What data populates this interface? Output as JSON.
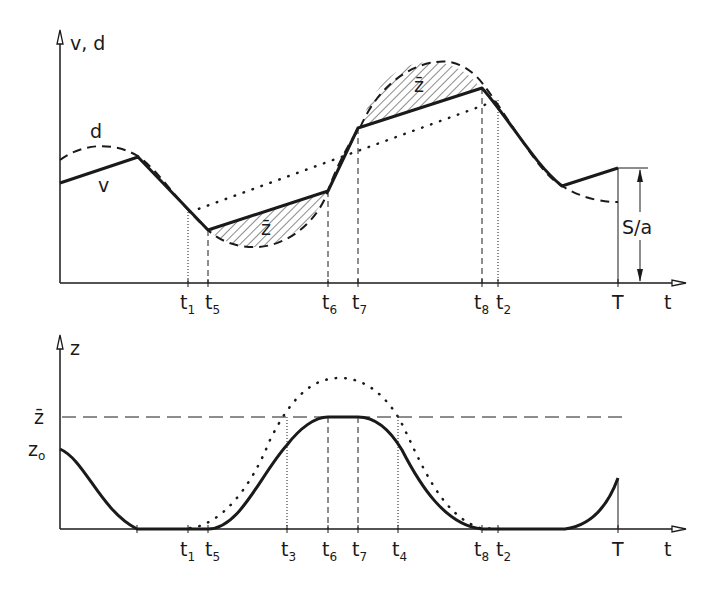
{
  "top_panel": {
    "y_axis_label": "v, d",
    "x_axis_label": "t",
    "curve_labels": {
      "d": "d",
      "v": "v"
    },
    "area_label": "z̄",
    "dimension_label": "S/a",
    "ticks": [
      {
        "name": "t",
        "sub": "1"
      },
      {
        "name": "t",
        "sub": "5"
      },
      {
        "name": "t",
        "sub": "6"
      },
      {
        "name": "t",
        "sub": "7"
      },
      {
        "name": "t",
        "sub": "8"
      },
      {
        "name": "t",
        "sub": "2"
      },
      {
        "name": "T",
        "sub": ""
      }
    ]
  },
  "bottom_panel": {
    "y_axis_label": "z",
    "x_axis_label": "t",
    "y_ticks": {
      "zbar": "z̄",
      "z0": "z",
      "z0_sub": "o"
    },
    "ticks": [
      {
        "name": "t",
        "sub": "1"
      },
      {
        "name": "t",
        "sub": "5"
      },
      {
        "name": "t",
        "sub": "3"
      },
      {
        "name": "t",
        "sub": "6"
      },
      {
        "name": "t",
        "sub": "7"
      },
      {
        "name": "t",
        "sub": "4"
      },
      {
        "name": "t",
        "sub": "8"
      },
      {
        "name": "t",
        "sub": "2"
      },
      {
        "name": "T",
        "sub": ""
      }
    ]
  },
  "colors": {
    "ink": "#1a1a1a",
    "background": "#ffffff"
  }
}
